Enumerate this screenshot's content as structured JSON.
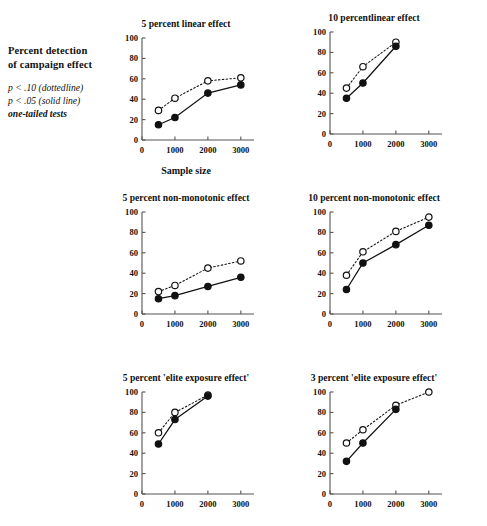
{
  "legend": {
    "title_line1": "Percent detection",
    "title_line2": "of campaign effect",
    "note1": "p < .10  (dottedline)",
    "note2": "p < .05  (solid line)",
    "note3": "one-tailed tests"
  },
  "axis": {
    "xlabel": "Sample size",
    "xticks": [
      "0",
      "1000",
      "2000",
      "3000"
    ],
    "yticks": [
      "0",
      "20",
      "40",
      "60",
      "80",
      "100"
    ]
  },
  "series_names": {
    "dotted": "p < .10 (dotted line)",
    "solid": "p < .05 (solid line)"
  },
  "colors": {
    "line": "#111111",
    "marker_open_fill": "#ffffff",
    "marker_solid_fill": "#111111",
    "axis": "#555555",
    "background": "#ffffff"
  },
  "chart_data": [
    {
      "type": "line",
      "title": "5 percent linear effect",
      "xlabel": "Sample size",
      "ylabel": "Percent detection of campaign effect",
      "xlim": [
        0,
        3400
      ],
      "ylim": [
        0,
        100
      ],
      "xticks": [
        0,
        1000,
        2000,
        3000
      ],
      "yticks": [
        0,
        20,
        40,
        60,
        80,
        100
      ],
      "grid": false,
      "legend_position": "external-left",
      "series": [
        {
          "name": "p < .10 (dotted line)",
          "style": "dotted",
          "marker": "open-circle",
          "x": [
            500,
            1000,
            2000,
            3000
          ],
          "values": [
            29,
            41,
            58,
            61
          ]
        },
        {
          "name": "p < .05 (solid line)",
          "style": "solid",
          "marker": "filled-circle",
          "x": [
            500,
            1000,
            2000,
            3000
          ],
          "values": [
            15,
            22,
            46,
            54
          ]
        }
      ]
    },
    {
      "type": "line",
      "title": "10 percentlinear effect",
      "xlabel": "",
      "ylabel": "",
      "xlim": [
        0,
        3400
      ],
      "ylim": [
        0,
        100
      ],
      "xticks": [
        0,
        1000,
        2000,
        3000
      ],
      "yticks": [
        0,
        20,
        40,
        60,
        80,
        100
      ],
      "grid": false,
      "series": [
        {
          "name": "p < .10 (dotted line)",
          "style": "dotted",
          "marker": "open-circle",
          "x": [
            500,
            1000,
            2000
          ],
          "values": [
            45,
            66,
            90
          ]
        },
        {
          "name": "p < .05 (solid line)",
          "style": "solid",
          "marker": "filled-circle",
          "x": [
            500,
            1000,
            2000
          ],
          "values": [
            35,
            50,
            86
          ]
        }
      ]
    },
    {
      "type": "line",
      "title": "5 percent non-monotonic effect",
      "xlabel": "",
      "ylabel": "",
      "xlim": [
        0,
        3400
      ],
      "ylim": [
        0,
        100
      ],
      "xticks": [
        0,
        1000,
        2000,
        3000
      ],
      "yticks": [
        0,
        20,
        40,
        60,
        80,
        100
      ],
      "grid": false,
      "series": [
        {
          "name": "p < .10 (dotted line)",
          "style": "dotted",
          "marker": "open-circle",
          "x": [
            500,
            1000,
            2000,
            3000
          ],
          "values": [
            22,
            28,
            45,
            52
          ]
        },
        {
          "name": "p < .05 (solid line)",
          "style": "solid",
          "marker": "filled-circle",
          "x": [
            500,
            1000,
            2000,
            3000
          ],
          "values": [
            15,
            18,
            27,
            36
          ]
        }
      ]
    },
    {
      "type": "line",
      "title": "10 percent non-monotonic effect",
      "xlabel": "",
      "ylabel": "",
      "xlim": [
        0,
        3400
      ],
      "ylim": [
        0,
        100
      ],
      "xticks": [
        0,
        1000,
        2000,
        3000
      ],
      "yticks": [
        0,
        20,
        40,
        60,
        80,
        100
      ],
      "grid": false,
      "series": [
        {
          "name": "p < .10 (dotted line)",
          "style": "dotted",
          "marker": "open-circle",
          "x": [
            500,
            1000,
            2000,
            3000
          ],
          "values": [
            38,
            61,
            81,
            95
          ]
        },
        {
          "name": "p < .05 (solid line)",
          "style": "solid",
          "marker": "filled-circle",
          "x": [
            500,
            1000,
            2000,
            3000
          ],
          "values": [
            24,
            50,
            68,
            87
          ]
        }
      ]
    },
    {
      "type": "line",
      "title": "5 percent 'elite exposure effect'",
      "xlabel": "",
      "ylabel": "",
      "xlim": [
        0,
        3400
      ],
      "ylim": [
        0,
        100
      ],
      "xticks": [
        0,
        1000,
        2000,
        3000
      ],
      "yticks": [
        0,
        20,
        40,
        60,
        80,
        100
      ],
      "grid": false,
      "series": [
        {
          "name": "p < .10 (dotted line)",
          "style": "dotted",
          "marker": "open-circle",
          "x": [
            500,
            1000,
            2000
          ],
          "values": [
            60,
            80,
            97
          ]
        },
        {
          "name": "p < .05 (solid line)",
          "style": "solid",
          "marker": "filled-circle",
          "x": [
            500,
            1000,
            2000
          ],
          "values": [
            49,
            73,
            96
          ]
        }
      ]
    },
    {
      "type": "line",
      "title": "3 percent 'elite exposure effect'",
      "xlabel": "",
      "ylabel": "",
      "xlim": [
        0,
        3400
      ],
      "ylim": [
        0,
        100
      ],
      "xticks": [
        0,
        1000,
        2000,
        3000
      ],
      "yticks": [
        0,
        20,
        40,
        60,
        80,
        100
      ],
      "grid": false,
      "series": [
        {
          "name": "p < .10 (dotted line)",
          "style": "dotted",
          "marker": "open-circle",
          "x": [
            500,
            1000,
            2000,
            3000
          ],
          "values": [
            50,
            63,
            87,
            100
          ]
        },
        {
          "name": "p < .05 (solid line)",
          "style": "solid",
          "marker": "filled-circle",
          "x": [
            500,
            1000,
            2000
          ],
          "values": [
            32,
            50,
            83
          ]
        }
      ]
    }
  ],
  "panel_layout": [
    {
      "left": 112,
      "top": 18,
      "width": 148,
      "height": 132,
      "show_xlabel": true
    },
    {
      "left": 300,
      "top": 12,
      "width": 148,
      "height": 132,
      "show_xlabel": false
    },
    {
      "left": 112,
      "top": 192,
      "width": 148,
      "height": 132,
      "show_xlabel": false
    },
    {
      "left": 300,
      "top": 192,
      "width": 148,
      "height": 132,
      "show_xlabel": false
    },
    {
      "left": 112,
      "top": 372,
      "width": 148,
      "height": 132,
      "show_xlabel": false
    },
    {
      "left": 300,
      "top": 372,
      "width": 148,
      "height": 132,
      "show_xlabel": false
    }
  ]
}
